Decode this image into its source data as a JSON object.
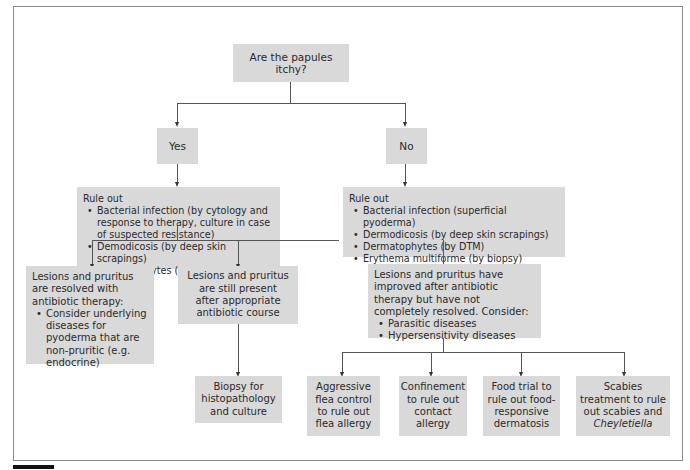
{
  "root": {
    "question": "Are the papules itchy?"
  },
  "branches": {
    "yes": {
      "label": "Yes"
    },
    "no": {
      "label": "No"
    }
  },
  "yes_ruleout": {
    "heading": "Rule out",
    "items": [
      "Bacterial infection (by cytology and response to therapy, culture in case of suspected resistance)",
      "Demodicosis (by deep skin scrapings)",
      "Dermatophytes (by DTM)"
    ]
  },
  "no_ruleout": {
    "heading": "Rule out",
    "items": [
      "Bacterial infection (superficial pyoderma)",
      "Dermodicosis (by deep skin scrapings)",
      "Dermatophytes (by DTM)",
      "Erythema multiforme (by biopsy)"
    ]
  },
  "outcomes": {
    "resolved": {
      "text": "Lesions and pruritus are resolved with antibiotic therapy:",
      "items": [
        "Consider underlying diseases for pyoderma that are non-pruritic (e.g. endocrine)"
      ]
    },
    "still_present": {
      "text": "Lesions and pruritus are still present after appropriate antibiotic course"
    },
    "improved": {
      "text": "Lesions and pruritus have improved after antibiotic therapy but have not completely resolved. Consider:",
      "items": [
        "Parasitic diseases",
        "Hypersensitivity diseases"
      ]
    }
  },
  "actions": {
    "biopsy": "Biopsy for histopathology and culture",
    "flea": "Aggressive flea control to rule out flea allergy",
    "confinement": "Confinement to rule out contact allergy",
    "food": "Food trial to rule out food-responsive dermatosis",
    "scabies_prefix": "Scabies treatment to rule out scabies and",
    "scabies_italic": "Cheyletiella"
  },
  "colors": {
    "box_fill": "#d9d9d9",
    "line": "#555555",
    "frame": "#8a8a8a"
  }
}
